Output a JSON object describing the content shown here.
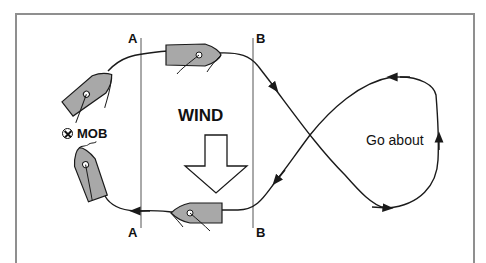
{
  "diagram": {
    "type": "figure-of-eight man-overboard recovery manoeuvre",
    "labels": {
      "line_a_top": "A",
      "line_a_bottom": "A",
      "line_b_top": "B",
      "line_b_bottom": "B",
      "wind": "WIND",
      "mob": "MOB",
      "go_about": "Go about"
    },
    "icons": {
      "mob_marker": "circled-cross-icon",
      "wind_arrow": "down-arrow-icon",
      "boat": "sailing-dinghy-icon"
    },
    "colors": {
      "boat_fill": "#a8a8a8",
      "line": "#1a1a1a",
      "frame": "#8f8f8f",
      "background": "#ffffff"
    },
    "boats": [
      {
        "position": "top-left, near MOB",
        "heading": "up-right"
      },
      {
        "position": "top-center, between A and B",
        "heading": "right"
      },
      {
        "position": "bottom-left, beside MOB",
        "heading": "up"
      },
      {
        "position": "bottom-center, between A and B",
        "heading": "left"
      }
    ]
  }
}
